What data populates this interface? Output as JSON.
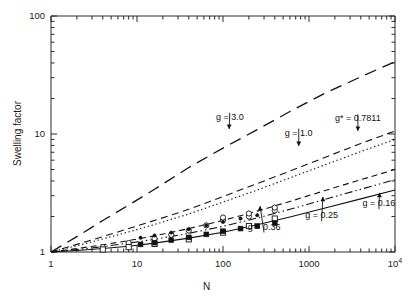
{
  "chart_data": {
    "type": "line",
    "title": "",
    "xlabel": "N",
    "ylabel": "Swelling factor",
    "xscale": "log",
    "yscale": "log",
    "xlim": [
      1,
      10000
    ],
    "ylim": [
      1,
      100
    ],
    "grid": false,
    "legend": "annotations-with-arrows",
    "xticks": [
      "1",
      "10",
      "100",
      "1000",
      "10⁴"
    ],
    "xtick_values": [
      1,
      10,
      100,
      1000,
      10000
    ],
    "yticks": [
      "1",
      "10",
      "100"
    ],
    "ytick_values": [
      1,
      10,
      100
    ],
    "series": [
      {
        "name": "g = 3.0",
        "label": "g = 3.0",
        "style": "long-dashed",
        "x": [
          1,
          2,
          4,
          8,
          16,
          40,
          100,
          250,
          600,
          1500,
          4000,
          10000
        ],
        "y": [
          1.0,
          1.35,
          1.85,
          2.5,
          3.4,
          5.2,
          7.6,
          10.9,
          15.5,
          22.0,
          30.5,
          41.0
        ]
      },
      {
        "name": "g = 1.0",
        "label": "g = 1.0",
        "style": "short-dashed",
        "x": [
          1,
          2,
          4,
          8,
          16,
          40,
          100,
          250,
          600,
          1500,
          4000,
          10000
        ],
        "y": [
          1.0,
          1.16,
          1.35,
          1.58,
          1.85,
          2.3,
          2.95,
          3.8,
          4.85,
          6.3,
          8.3,
          10.6
        ]
      },
      {
        "name": "g* = 0.7811",
        "label": "g* = 0.7811",
        "style": "dotted",
        "x": [
          1,
          2,
          4,
          8,
          16,
          40,
          100,
          250,
          600,
          1500,
          4000,
          10000
        ],
        "y": [
          1.0,
          1.13,
          1.29,
          1.48,
          1.71,
          2.1,
          2.65,
          3.35,
          4.25,
          5.45,
          7.1,
          9.0
        ]
      },
      {
        "name": "g = 0.36",
        "label": "g = 0.36",
        "style": "dashed",
        "x": [
          1,
          2,
          4,
          8,
          16,
          40,
          100,
          250,
          600,
          1500,
          4000,
          10000
        ],
        "y": [
          1.0,
          1.07,
          1.15,
          1.25,
          1.37,
          1.58,
          1.85,
          2.22,
          2.68,
          3.3,
          4.1,
          5.0
        ]
      },
      {
        "name": "g = 0.25",
        "label": "g = 0.25",
        "style": "dash-dot-dot",
        "x": [
          1,
          2,
          4,
          8,
          16,
          40,
          100,
          250,
          600,
          1500,
          4000,
          10000
        ],
        "y": [
          1.0,
          1.05,
          1.11,
          1.19,
          1.28,
          1.44,
          1.65,
          1.94,
          2.3,
          2.78,
          3.4,
          4.1
        ]
      },
      {
        "name": "g = 0.16",
        "label": "g = 0.16",
        "style": "solid",
        "x": [
          1,
          2,
          4,
          8,
          16,
          40,
          100,
          250,
          600,
          1500,
          4000,
          10000
        ],
        "y": [
          1.0,
          1.03,
          1.07,
          1.12,
          1.19,
          1.31,
          1.47,
          1.7,
          1.98,
          2.35,
          2.82,
          3.35
        ]
      }
    ],
    "datasets": [
      {
        "name": "open-circles",
        "marker": "open-circle",
        "x": [
          4,
          8,
          16,
          25,
          40,
          64,
          100,
          100,
          200,
          200,
          400,
          400
        ],
        "y": [
          1.1,
          1.19,
          1.3,
          1.4,
          1.52,
          1.68,
          1.86,
          1.96,
          2.0,
          2.12,
          2.25,
          2.38
        ]
      },
      {
        "name": "open-squares",
        "marker": "open-square",
        "x": [
          4,
          8,
          16,
          40,
          100,
          200,
          400
        ],
        "y": [
          1.05,
          1.1,
          1.17,
          1.28,
          1.46,
          1.66,
          1.92
        ]
      },
      {
        "name": "filled-squares",
        "marker": "filled-square",
        "x": [
          11,
          16,
          25,
          40,
          64,
          100,
          160,
          250,
          400
        ],
        "y": [
          1.16,
          1.2,
          1.26,
          1.33,
          1.41,
          1.5,
          1.58,
          1.66,
          1.76
        ]
      },
      {
        "name": "filled-circles-small",
        "marker": "filled-circle",
        "x": [
          11,
          16,
          25,
          40,
          64,
          100,
          160,
          250
        ],
        "y": [
          1.32,
          1.38,
          1.46,
          1.56,
          1.68,
          1.8,
          1.92,
          2.05
        ]
      }
    ],
    "annotations": [
      {
        "text": "g = 3.0",
        "label_x": 120,
        "label_y": 17.0,
        "arrow_to_x": 118,
        "arrow_to_y": 10.6
      },
      {
        "text": "g = 1.0",
        "label_x": 760,
        "label_y": 12.5,
        "arrow_to_x": 760,
        "arrow_to_y": 7.6
      },
      {
        "text": "g* = 0.7811",
        "label_x": 3700,
        "label_y": 16.5,
        "arrow_to_x": 3700,
        "arrow_to_y": 10.2
      },
      {
        "text": "g = 0.36",
        "label_x": 300,
        "label_y": 1.3,
        "arrow_to_x": 270,
        "arrow_to_y": 2.55
      },
      {
        "text": "g = 0.25",
        "label_x": 1400,
        "label_y": 1.62,
        "arrow_to_x": 1450,
        "arrow_to_y": 3.05
      },
      {
        "text": "g = 0.16",
        "label_x": 6500,
        "label_y": 2.05,
        "arrow_to_x": 6600,
        "arrow_to_y": 3.3
      }
    ]
  }
}
